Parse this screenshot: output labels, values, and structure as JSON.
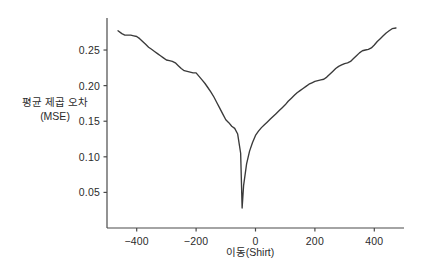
{
  "chart_data": {
    "type": "line",
    "title": "",
    "xlabel": "이동(Shirt)",
    "ylabel_line1": "평균 제곱 오차",
    "ylabel_line2": "(MSE)",
    "xlim": [
      -500,
      500
    ],
    "ylim": [
      0.0,
      0.295
    ],
    "grid": false,
    "legend": null,
    "line_color": "#3a3a3a",
    "axis_color": "#4a4a4a",
    "tick_color": "#2b2b2b",
    "background_color": "#ffffff",
    "xticks": [
      -400,
      -200,
      0,
      200,
      400
    ],
    "xtick_labels": [
      "−400",
      "−200",
      "0",
      "200",
      "400"
    ],
    "yticks": [
      0.05,
      0.1,
      0.15,
      0.2,
      0.25
    ],
    "ytick_labels": [
      "0.05",
      "0.10",
      "0.15",
      "0.20",
      "0.25"
    ],
    "series": [
      {
        "name": "MSE vs shift",
        "x": [
          -463,
          -450,
          -440,
          -430,
          -420,
          -410,
          -400,
          -390,
          -380,
          -370,
          -360,
          -350,
          -340,
          -330,
          -320,
          -310,
          -300,
          -290,
          -280,
          -270,
          -260,
          -250,
          -240,
          -230,
          -220,
          -210,
          -200,
          -190,
          -180,
          -170,
          -160,
          -150,
          -140,
          -130,
          -120,
          -110,
          -100,
          -90,
          -80,
          -70,
          -60,
          -50,
          -45,
          -40,
          -30,
          -20,
          -10,
          0,
          10,
          20,
          30,
          40,
          50,
          60,
          70,
          80,
          90,
          100,
          110,
          120,
          130,
          140,
          150,
          160,
          170,
          180,
          190,
          200,
          210,
          220,
          230,
          240,
          250,
          260,
          270,
          280,
          290,
          300,
          310,
          320,
          330,
          340,
          350,
          360,
          370,
          380,
          390,
          400,
          410,
          420,
          430,
          440,
          450,
          460,
          473
        ],
        "y": [
          0.277,
          0.273,
          0.271,
          0.271,
          0.271,
          0.27,
          0.269,
          0.266,
          0.262,
          0.258,
          0.254,
          0.251,
          0.248,
          0.245,
          0.242,
          0.239,
          0.236,
          0.235,
          0.234,
          0.232,
          0.228,
          0.224,
          0.221,
          0.22,
          0.219,
          0.218,
          0.218,
          0.213,
          0.208,
          0.203,
          0.197,
          0.191,
          0.184,
          0.176,
          0.168,
          0.16,
          0.152,
          0.148,
          0.143,
          0.14,
          0.132,
          0.105,
          0.028,
          0.06,
          0.09,
          0.108,
          0.12,
          0.13,
          0.136,
          0.141,
          0.145,
          0.149,
          0.153,
          0.157,
          0.161,
          0.165,
          0.169,
          0.173,
          0.178,
          0.182,
          0.186,
          0.19,
          0.193,
          0.196,
          0.199,
          0.202,
          0.204,
          0.206,
          0.207,
          0.208,
          0.209,
          0.212,
          0.216,
          0.22,
          0.224,
          0.227,
          0.229,
          0.231,
          0.232,
          0.234,
          0.238,
          0.242,
          0.246,
          0.249,
          0.25,
          0.251,
          0.253,
          0.257,
          0.262,
          0.266,
          0.27,
          0.274,
          0.277,
          0.28,
          0.281
        ]
      }
    ],
    "annotations": {
      "minimum_x": -50,
      "minimum_y": 0.028
    }
  }
}
